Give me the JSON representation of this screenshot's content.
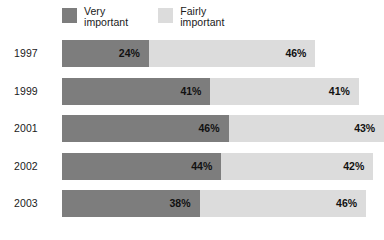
{
  "legend": {
    "entries": [
      {
        "label": "Very\nimportant",
        "color": "#7d7d7d",
        "key": "very_important"
      },
      {
        "label": "Fairly\nimportant",
        "color": "#dcdcdc",
        "key": "fairly_important"
      }
    ]
  },
  "chart_data": {
    "type": "bar",
    "orientation": "horizontal",
    "stacked": true,
    "title": "",
    "subtitle": "",
    "xlabel": "",
    "ylabel": "",
    "grid": false,
    "legend_position": "top-left",
    "xlim": [
      0,
      100
    ],
    "unit": "%",
    "categories": [
      "1997",
      "1999",
      "2001",
      "2002",
      "2003"
    ],
    "series": [
      {
        "name": "Very important",
        "color": "#7d7d7d",
        "values": [
          24,
          41,
          46,
          44,
          38
        ]
      },
      {
        "name": "Fairly important",
        "color": "#dcdcdc",
        "values": [
          46,
          41,
          43,
          42,
          46
        ]
      }
    ],
    "rows": [
      {
        "year": "1997",
        "segments": [
          {
            "series": "Very important",
            "value": 24,
            "label": "24%"
          },
          {
            "series": "Fairly important",
            "value": 46,
            "label": "46%"
          }
        ]
      },
      {
        "year": "1999",
        "segments": [
          {
            "series": "Very important",
            "value": 41,
            "label": "41%"
          },
          {
            "series": "Fairly important",
            "value": 41,
            "label": "41%"
          }
        ]
      },
      {
        "year": "2001",
        "segments": [
          {
            "series": "Very important",
            "value": 46,
            "label": "46%"
          },
          {
            "series": "Fairly important",
            "value": 43,
            "label": "43%"
          }
        ]
      },
      {
        "year": "2002",
        "segments": [
          {
            "series": "Very important",
            "value": 44,
            "label": "44%"
          },
          {
            "series": "Fairly important",
            "value": 42,
            "label": "42%"
          }
        ]
      },
      {
        "year": "2003",
        "segments": [
          {
            "series": "Very important",
            "value": 38,
            "label": "38%"
          },
          {
            "series": "Fairly important",
            "value": 46,
            "label": "46%"
          }
        ]
      }
    ]
  },
  "layout": {
    "px_per_percent": 3.62
  }
}
